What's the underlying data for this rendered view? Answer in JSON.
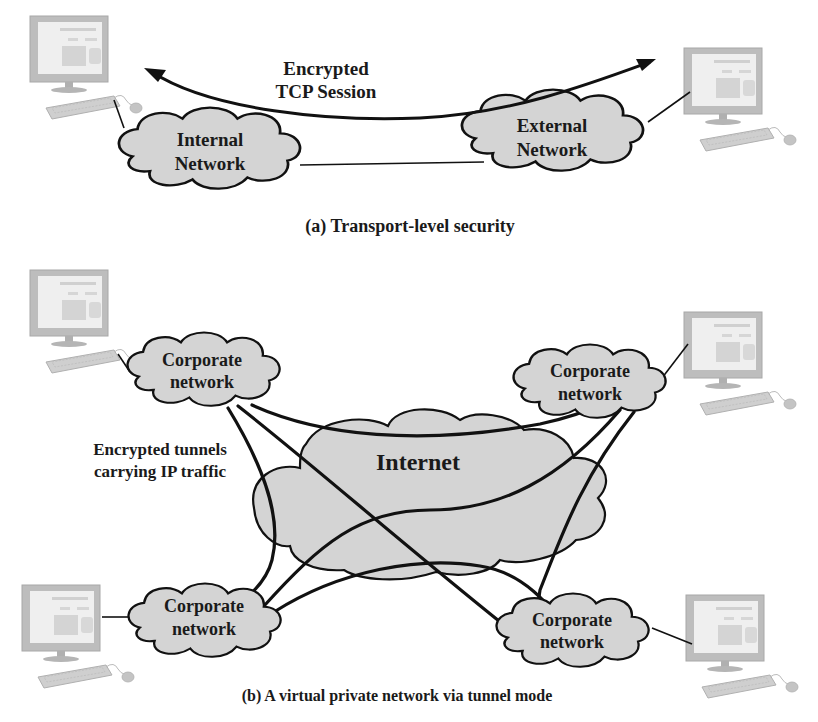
{
  "panel_a": {
    "caption": "(a) Transport-level security",
    "session_label_line1": "Encrypted",
    "session_label_line2": "TCP Session",
    "internal_cloud": {
      "line1": "Internal",
      "line2": "Network"
    },
    "external_cloud": {
      "line1": "External",
      "line2": "Network"
    },
    "hosts": [
      "computer-left",
      "computer-right"
    ]
  },
  "panel_b": {
    "caption": "(b) A virtual private network via tunnel mode",
    "tunnel_label_line1": "Encrypted tunnels",
    "tunnel_label_line2": "carrying IP traffic",
    "internet_label": "Internet",
    "corporate_clouds": [
      {
        "position": "top-left",
        "line1": "Corporate",
        "line2": "network"
      },
      {
        "position": "top-right",
        "line1": "Corporate",
        "line2": "network"
      },
      {
        "position": "bottom-left",
        "line1": "Corporate",
        "line2": "network"
      },
      {
        "position": "bottom-right",
        "line1": "Corporate",
        "line2": "network"
      }
    ],
    "hosts": [
      "computer-top-left",
      "computer-top-right",
      "computer-bottom-left",
      "computer-bottom-right"
    ]
  },
  "colors": {
    "cloud_fill": "#d4d4d4",
    "stroke": "#111111",
    "monitor": "#c8c8c8",
    "background": "#ffffff"
  }
}
